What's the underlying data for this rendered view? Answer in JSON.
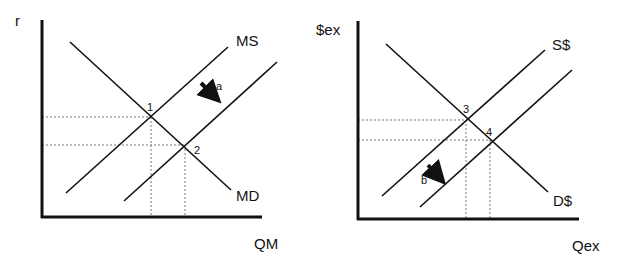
{
  "colors": {
    "line": "#111111",
    "guide": "#555555",
    "background": "#ffffff"
  },
  "diagrams": [
    {
      "id": "money-market",
      "y_axis_label": "r",
      "x_axis_label": "QM",
      "curves": [
        {
          "id": "md",
          "label": "MD",
          "kind": "demand"
        },
        {
          "id": "ms",
          "label": "MS",
          "kind": "supply-initial"
        },
        {
          "id": "ms2",
          "label": "",
          "kind": "supply-shifted"
        }
      ],
      "equilibria": [
        {
          "label": "1",
          "between": [
            "md",
            "ms"
          ]
        },
        {
          "label": "2",
          "between": [
            "md",
            "ms2"
          ]
        }
      ],
      "shift_arrow": {
        "label": "a",
        "direction": "down-right"
      }
    },
    {
      "id": "fx-market",
      "y_axis_label": "$ex",
      "x_axis_label": "Qex",
      "curves": [
        {
          "id": "d",
          "label": "D$",
          "kind": "demand"
        },
        {
          "id": "s",
          "label": "S$",
          "kind": "supply-initial"
        },
        {
          "id": "s2",
          "label": "",
          "kind": "supply-shifted"
        }
      ],
      "equilibria": [
        {
          "label": "3",
          "between": [
            "d",
            "s"
          ]
        },
        {
          "label": "4",
          "between": [
            "d",
            "s2"
          ]
        }
      ],
      "shift_arrow": {
        "label": "b",
        "direction": "down-right"
      }
    }
  ]
}
